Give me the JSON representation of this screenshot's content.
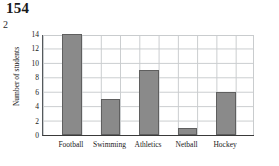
{
  "page": {
    "page_number": "154",
    "question_number": "2"
  },
  "chart_data": {
    "type": "bar",
    "title": "",
    "xlabel": "",
    "ylabel": "Number of students",
    "categories": [
      "Football",
      "Swimming",
      "Athletics",
      "Netball",
      "Hockey"
    ],
    "values": [
      14,
      5,
      9,
      1,
      6
    ],
    "ylim": [
      0,
      14
    ],
    "ytick_labels": [
      "0",
      "2",
      "4",
      "6",
      "8",
      "10",
      "12",
      "14"
    ],
    "ytick_values": [
      0,
      2,
      4,
      6,
      8,
      10,
      12,
      14
    ],
    "grid": true,
    "legend": "none",
    "bar_color": "#8a8a8a",
    "bar_edge_color": "#5f5f5f",
    "grid_color": "#c9ccce",
    "axis_color": "#3a3a3a",
    "columns": 11,
    "bar_column_indices": [
      1,
      3,
      5,
      7,
      9
    ]
  }
}
